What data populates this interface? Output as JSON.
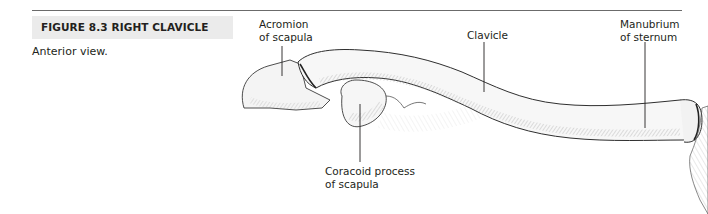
{
  "figure": {
    "number_title": "FIGURE 8.3  RIGHT CLAVICLE",
    "caption": "Anterior view."
  },
  "labels": {
    "acromion": [
      "Acromion",
      "of scapula"
    ],
    "clavicle": "Clavicle",
    "manubrium": [
      "Manubrium",
      "of sternum"
    ],
    "coracoid": [
      "Coracoid process",
      "of scapula"
    ]
  },
  "colors": {
    "header_bg": "#ebebeb",
    "rule": "#6b6b6b",
    "ink": "#231f20"
  }
}
